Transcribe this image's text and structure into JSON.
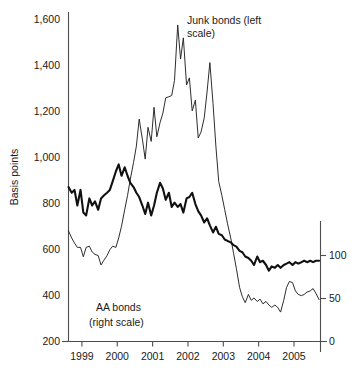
{
  "chart_data": {
    "type": "line",
    "title": "",
    "xlabel": "",
    "ylabel": "Basis points",
    "y2label": "",
    "grid": false,
    "legend_position": "inline-annotations",
    "xlim": [
      1998.62,
      2005.75
    ],
    "ylim": [
      200,
      1600
    ],
    "y2lim": [
      0,
      116.3
    ],
    "x_tick_labels": [
      "1999",
      "2000",
      "2001",
      "2002",
      "2003",
      "2004",
      "2005"
    ],
    "x_ticks": [
      1999,
      2000,
      2001,
      2002,
      2003,
      2004,
      2005
    ],
    "y_tick_labels": [
      "200",
      "400",
      "600",
      "800",
      "1,000",
      "1,200",
      "1,400",
      "1,600"
    ],
    "y_ticks": [
      200,
      400,
      600,
      800,
      1000,
      1200,
      1400,
      1600
    ],
    "y2_tick_labels": [
      "0",
      "50",
      "100"
    ],
    "y2_ticks": [
      0,
      50,
      100
    ],
    "annotations": [
      {
        "id": "junk-annotation",
        "lines": [
          "Junk bonds (left",
          "scale)"
        ],
        "x": 187,
        "y": 22
      },
      {
        "id": "aa-annotation",
        "lines": [
          "AA bonds",
          "(right scale)"
        ],
        "x": 96,
        "y": 308
      }
    ],
    "series": [
      {
        "name": "Junk bonds (left scale)",
        "axis": "left",
        "units": "Basis points",
        "stroke": "#222222",
        "width": 0.95,
        "x": [
          1998.62,
          1998.71,
          1998.79,
          1998.87,
          1998.96,
          1999.04,
          1999.12,
          1999.21,
          1999.29,
          1999.37,
          1999.46,
          1999.54,
          1999.62,
          1999.71,
          1999.79,
          1999.87,
          1999.96,
          2000.04,
          2000.12,
          2000.21,
          2000.29,
          2000.37,
          2000.46,
          2000.54,
          2000.62,
          2000.71,
          2000.79,
          2000.87,
          2000.96,
          2001.04,
          2001.12,
          2001.21,
          2001.29,
          2001.37,
          2001.46,
          2001.54,
          2001.62,
          2001.71,
          2001.79,
          2001.87,
          2001.96,
          2002.04,
          2002.12,
          2002.21,
          2002.29,
          2002.37,
          2002.46,
          2002.54,
          2002.62,
          2002.71,
          2002.79,
          2002.87,
          2002.96,
          2003.04,
          2003.12,
          2003.21,
          2003.29,
          2003.37,
          2003.46,
          2003.54,
          2003.62,
          2003.71,
          2003.79,
          2003.87,
          2003.96,
          2004.04,
          2004.12,
          2004.21,
          2004.29,
          2004.37,
          2004.46,
          2004.54,
          2004.62,
          2004.71,
          2004.79,
          2004.87,
          2004.96,
          2005.04,
          2005.12,
          2005.21,
          2005.29,
          2005.37,
          2005.46,
          2005.54,
          2005.62,
          2005.71
        ],
        "values": [
          670,
          640,
          618,
          600,
          600,
          560,
          600,
          605,
          580,
          570,
          565,
          525,
          545,
          565,
          590,
          605,
          600,
          640,
          690,
          760,
          820,
          890,
          960,
          1030,
          1145,
          1060,
          975,
          1110,
          1050,
          1195,
          1070,
          1130,
          1170,
          1235,
          1240,
          1245,
          1310,
          1545,
          1400,
          1490,
          1290,
          1320,
          1180,
          1225,
          1065,
          1090,
          1150,
          1260,
          1385,
          1210,
          1030,
          880,
          820,
          760,
          700,
          640,
          575,
          510,
          430,
          390,
          365,
          400,
          375,
          385,
          370,
          380,
          360,
          370,
          355,
          345,
          355,
          345,
          325,
          375,
          430,
          455,
          450,
          415,
          400,
          395,
          400,
          410,
          415,
          425,
          405,
          378
        ]
      },
      {
        "name": "AA bonds (right scale)",
        "axis": "right",
        "units": "Basis points",
        "stroke": "#111111",
        "width": 2.1,
        "x": [
          1998.62,
          1998.71,
          1998.79,
          1998.87,
          1998.96,
          1999.04,
          1999.12,
          1999.21,
          1999.29,
          1999.37,
          1999.46,
          1999.54,
          1999.62,
          1999.71,
          1999.79,
          1999.87,
          1999.96,
          2000.04,
          2000.12,
          2000.21,
          2000.29,
          2000.37,
          2000.46,
          2000.54,
          2000.62,
          2000.71,
          2000.79,
          2000.87,
          2000.96,
          2001.04,
          2001.12,
          2001.21,
          2001.29,
          2001.37,
          2001.46,
          2001.54,
          2001.62,
          2001.71,
          2001.79,
          2001.87,
          2001.96,
          2002.04,
          2002.12,
          2002.21,
          2002.29,
          2002.37,
          2002.46,
          2002.54,
          2002.62,
          2002.71,
          2002.79,
          2002.87,
          2002.96,
          2003.04,
          2003.12,
          2003.21,
          2003.29,
          2003.37,
          2003.46,
          2003.54,
          2003.62,
          2003.71,
          2003.79,
          2003.87,
          2003.96,
          2004.04,
          2004.12,
          2004.21,
          2004.29,
          2004.37,
          2004.46,
          2004.54,
          2004.62,
          2004.71,
          2004.79,
          2004.87,
          2004.96,
          2005.04,
          2005.12,
          2005.21,
          2005.29,
          2005.37,
          2005.46,
          2005.54,
          2005.62,
          2005.71
        ],
        "values": [
          54.5,
          52.5,
          53.5,
          48.0,
          53.5,
          45.5,
          44.5,
          50.5,
          48.0,
          49.5,
          46.5,
          50.5,
          51.5,
          52.5,
          53.5,
          56.5,
          60.0,
          62.5,
          58.5,
          61.5,
          58.5,
          56.0,
          54.5,
          52.5,
          51.0,
          48.0,
          45.0,
          49.0,
          44.5,
          48.0,
          52.5,
          56.0,
          54.0,
          50.0,
          52.5,
          47.5,
          49.0,
          47.5,
          48.5,
          45.5,
          50.5,
          51.0,
          52.5,
          48.5,
          46.0,
          44.5,
          42.0,
          43.5,
          41.0,
          38.5,
          40.5,
          38.0,
          37.5,
          36.0,
          35.5,
          35.0,
          34.0,
          33.5,
          32.0,
          31.5,
          30.0,
          29.5,
          28.5,
          27.0,
          30.0,
          28.0,
          28.5,
          27.0,
          25.0,
          26.5,
          26.0,
          27.0,
          26.0,
          27.0,
          27.5,
          28.0,
          27.0,
          28.0,
          27.5,
          28.0,
          28.5,
          28.0,
          28.5,
          28.0,
          28.5,
          28.5
        ]
      }
    ]
  },
  "axes": {
    "left_axis_title": "Basis points"
  }
}
